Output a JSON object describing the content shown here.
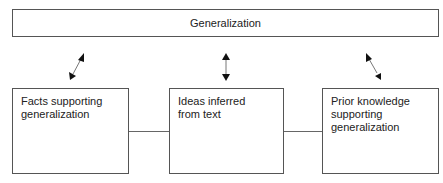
{
  "diagram": {
    "top_box": {
      "label": "Generalization"
    },
    "bottom_boxes": [
      {
        "label": "Facts supporting generalization"
      },
      {
        "label": "Ideas inferred from text"
      },
      {
        "label": "Prior knowledge supporting generalization"
      }
    ],
    "connectors": [
      {
        "from": "Facts supporting generalization",
        "to": "Generalization",
        "type": "double-arrow"
      },
      {
        "from": "Ideas inferred from text",
        "to": "Generalization",
        "type": "double-arrow"
      },
      {
        "from": "Prior knowledge supporting generalization",
        "to": "Generalization",
        "type": "double-arrow"
      },
      {
        "from": "Facts supporting generalization",
        "to": "Ideas inferred from text",
        "type": "line"
      },
      {
        "from": "Ideas inferred from text",
        "to": "Prior knowledge supporting generalization",
        "type": "line"
      }
    ]
  }
}
